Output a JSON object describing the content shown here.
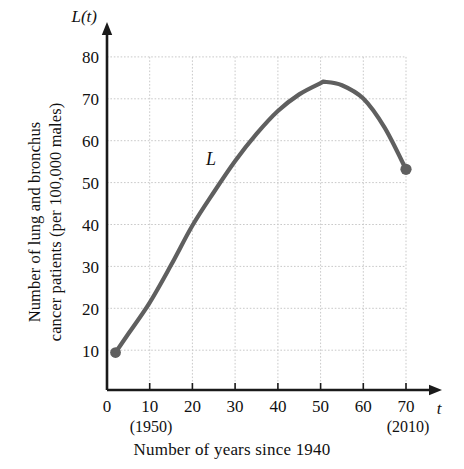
{
  "chart_data": {
    "type": "line",
    "title": "",
    "xlabel": "Number of years since 1940",
    "ylabel_line1": "Number of lung and bronchus",
    "ylabel_line2": "cancer patients (per 100,000 males)",
    "y_axis_name": "L(t)",
    "x_axis_name": "t",
    "curve_label": "L",
    "xlim": [
      0,
      75
    ],
    "ylim": [
      0,
      85
    ],
    "x_ticks": [
      0,
      10,
      20,
      30,
      40,
      50,
      60,
      70
    ],
    "x_tick_labels": [
      "0",
      "10",
      "20",
      "30",
      "40",
      "50",
      "60",
      "70"
    ],
    "x_tick_annotations": [
      {
        "at": 10,
        "text": "(1950)"
      },
      {
        "at": 70,
        "text": "(2010)"
      }
    ],
    "y_ticks": [
      10,
      20,
      30,
      40,
      50,
      60,
      70,
      80
    ],
    "y_tick_labels": [
      "10",
      "20",
      "30",
      "40",
      "50",
      "60",
      "70",
      "80"
    ],
    "grid": true,
    "grid_style": "dotted",
    "legend": "none",
    "x": [
      2,
      5,
      10,
      15,
      20,
      25,
      30,
      35,
      40,
      45,
      50,
      51,
      55,
      60,
      65,
      70
    ],
    "values": [
      9,
      13.5,
      21,
      30,
      39.5,
      47.5,
      55,
      61.5,
      67,
      71,
      73.7,
      74,
      73.2,
      70,
      63,
      53
    ],
    "markers": [
      {
        "x": 2,
        "y": 9,
        "label": "start-point"
      },
      {
        "x": 70,
        "y": 53,
        "label": "end-point"
      }
    ],
    "series": [
      {
        "name": "L",
        "x": [
          2,
          5,
          10,
          15,
          20,
          25,
          30,
          35,
          40,
          45,
          50,
          51,
          55,
          60,
          65,
          70
        ],
        "values": [
          9,
          13.5,
          21,
          30,
          39.5,
          47.5,
          55,
          61.5,
          67,
          71,
          73.7,
          74,
          73.2,
          70,
          63,
          53
        ]
      }
    ],
    "colors": {
      "curve": "#5f5f5f",
      "grid": "#c9c9c9",
      "axis": "#1a1a1a",
      "background": "#ffffff"
    }
  }
}
